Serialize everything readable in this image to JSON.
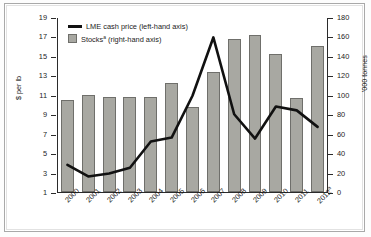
{
  "chart_data": {
    "type": "bar",
    "title": "",
    "subtitle": "",
    "xlabel": "",
    "ylabel": "$ per lb",
    "ylabel_right": "'000 tonnes",
    "grid": false,
    "legend_position": "top-left",
    "categories": [
      "2000",
      "2001",
      "2002",
      "2003",
      "2004",
      "2005",
      "2006",
      "2007",
      "2008",
      "2009",
      "2010",
      "2011",
      "2012"
    ],
    "category_labels": [
      "2000",
      "2001",
      "2002",
      "2003",
      "2004",
      "2005",
      "2006",
      "2007",
      "2008",
      "2009",
      "2010",
      "2011",
      "2012*"
    ],
    "ylim": [
      1,
      19
    ],
    "yticks": [
      1,
      3,
      5,
      7,
      9,
      11,
      13,
      15,
      17,
      19
    ],
    "ylim_right": [
      0,
      180
    ],
    "yticks_right": [
      0,
      20,
      40,
      60,
      80,
      100,
      120,
      140,
      160,
      180
    ],
    "series": [
      {
        "name": "Stocks* (right-hand axis)",
        "type": "bar",
        "axis": "right",
        "unit": "'000 tonnes",
        "color": "#a8a8a2",
        "values": [
          95,
          100,
          98,
          98,
          98,
          112,
          87,
          123,
          157,
          162,
          142,
          97,
          150
        ]
      },
      {
        "name": "LME cash price (left-hand axis)",
        "type": "line",
        "axis": "left",
        "unit": "$ per lb",
        "color": "#111111",
        "values": [
          3.9,
          2.7,
          3.0,
          3.6,
          6.3,
          6.7,
          11.0,
          17.0,
          9.1,
          6.6,
          9.9,
          9.5,
          7.8
        ]
      }
    ]
  },
  "legend": {
    "line_label": "LME cash price (left-hand axis)",
    "bar_label": "Stocks",
    "bar_label_sup": "a",
    "bar_label_tail": " (right-hand axis)"
  },
  "axis": {
    "left_title": "$ per lb",
    "right_title": "'000 tonnes"
  },
  "footnote_marker": "a"
}
